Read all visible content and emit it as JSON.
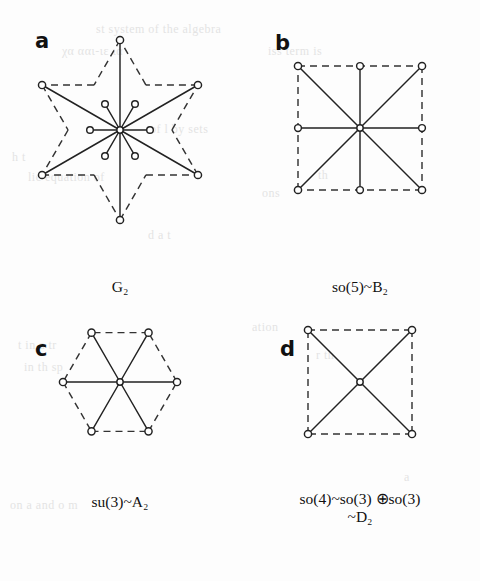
{
  "figure": {
    "background_color": "#fdfdfd",
    "ink_color": "#222222",
    "panels": [
      {
        "letter": "a",
        "caption": "G₂",
        "caption_plain": "G2",
        "diagram": "g2-root-system",
        "node_count": 12,
        "boundary": "hexagram",
        "inner_radius_px": 30,
        "outer_radius_px": 90,
        "description": "Twelve roots: six short inner roots and six long outer roots radiating from the origin; dashed star-of-David boundary."
      },
      {
        "letter": "b",
        "caption": "so(5)~B₂",
        "caption_plain": "so(5)~B2",
        "diagram": "b2-root-system",
        "node_count": 8,
        "boundary": "square",
        "half_side_px": 62,
        "description": "Eight roots: four short roots at the square edge midpoints and four long roots at the square corners; dashed square boundary."
      },
      {
        "letter": "c",
        "caption": "su(3)~A₂",
        "caption_plain": "su(3)~A2",
        "diagram": "a2-root-system",
        "node_count": 6,
        "boundary": "hexagon",
        "radius_px": 57,
        "description": "Six roots of equal length at the vertices of a regular hexagon; dashed hexagonal boundary."
      },
      {
        "letter": "d",
        "caption_lines": [
          "so(4)~so(3) ⊕so(3)",
          "~D₂"
        ],
        "caption_plain": "so(4)~so(3) (+)so(3) ~D2",
        "diagram": "d2-root-system",
        "node_count": 4,
        "boundary": "square",
        "half_side_px": 52,
        "description": "Four roots at the corners of a square forming an X through the origin; dashed square boundary."
      }
    ]
  },
  "bleed_through": [
    {
      "text": "st system of the algebra",
      "x": 96,
      "y": 22,
      "size": 12
    },
    {
      "text": "χα  ααι-ιε  ια",
      "x": 62,
      "y": 44,
      "size": 12
    },
    {
      "text": "iss term is",
      "x": 268,
      "y": 44,
      "size": 12
    },
    {
      "text": "of  l  by  sets",
      "x": 150,
      "y": 122,
      "size": 12
    },
    {
      "text": "h t",
      "x": 12,
      "y": 150,
      "size": 12
    },
    {
      "text": "lic equation of",
      "x": 28,
      "y": 170,
      "size": 12
    },
    {
      "text": "th",
      "x": 318,
      "y": 168,
      "size": 12
    },
    {
      "text": "ons",
      "x": 262,
      "y": 186,
      "size": 12
    },
    {
      "text": "d  a  t",
      "x": 148,
      "y": 228,
      "size": 12
    },
    {
      "text": "ation",
      "x": 252,
      "y": 320,
      "size": 12
    },
    {
      "text": "t   in  a   tr",
      "x": 18,
      "y": 338,
      "size": 12
    },
    {
      "text": "in  th   sp",
      "x": 24,
      "y": 360,
      "size": 12
    },
    {
      "text": "r   th",
      "x": 316,
      "y": 348,
      "size": 12
    },
    {
      "text": "on  a  and  o  m",
      "x": 10,
      "y": 498,
      "size": 12
    },
    {
      "text": "a",
      "x": 404,
      "y": 470,
      "size": 12
    }
  ]
}
